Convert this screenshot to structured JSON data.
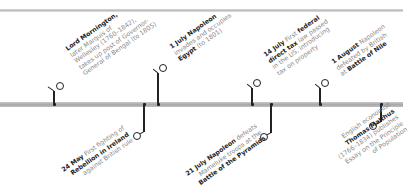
{
  "timeline": {
    "colors": {
      "bar": "#b0b0b0",
      "connector": "#222222",
      "bold_text": "#1e1e1e",
      "text": "#8a8a8a"
    },
    "events": [
      {
        "id": "mornington",
        "position": "above",
        "x": 54,
        "lines": [
          [
            {
              "b": "Lord Mornington,"
            }
          ],
          [
            {
              "t": "later Marquis of"
            }
          ],
          [
            {
              "t": "Wellesley (1760–1842),"
            }
          ],
          [
            {
              "t": "takes up post of Governor-"
            }
          ],
          [
            {
              "t": "General of Bengal (to 1805)"
            }
          ]
        ]
      },
      {
        "id": "egypt",
        "position": "above",
        "x": 158,
        "lines": [
          [
            {
              "b": "1 July Napoleon"
            }
          ],
          [
            {
              "t": "invades and occupies"
            }
          ],
          [
            {
              "b": "Egypt"
            },
            {
              "t": " (to 1801)"
            }
          ]
        ]
      },
      {
        "id": "federal-tax",
        "position": "above",
        "x": 252,
        "lines": [
          [
            {
              "b": "14 July"
            },
            {
              "t": " First "
            },
            {
              "b": "federal"
            }
          ],
          [
            {
              "b": "direct tax"
            },
            {
              "t": " law passed"
            }
          ],
          [
            {
              "t": "in the US, introducing"
            }
          ],
          [
            {
              "t": "tax on property"
            }
          ]
        ]
      },
      {
        "id": "nile",
        "position": "above",
        "x": 320,
        "lines": [
          [
            {
              "b": "1 August"
            },
            {
              "t": " Napoleon"
            }
          ],
          [
            {
              "t": "defeated by British"
            }
          ],
          [
            {
              "t": "at "
            },
            {
              "b": "Battle of Nile"
            }
          ]
        ]
      },
      {
        "id": "ireland",
        "position": "below",
        "x": 144,
        "lines": [
          [
            {
              "b": "24 May"
            },
            {
              "t": " First fighting of"
            }
          ],
          [
            {
              "b": "Rebellion in Ireland"
            }
          ],
          [
            {
              "t": "against British rule"
            }
          ]
        ]
      },
      {
        "id": "pyramids",
        "position": "below",
        "x": 271,
        "lines": [
          [
            {
              "b": "21 July Napoleon"
            },
            {
              "t": " defeats"
            }
          ],
          [
            {
              "t": "Mameluke troops at the"
            }
          ],
          [
            {
              "b": "Battle of the Pyramids"
            }
          ]
        ]
      },
      {
        "id": "malthus",
        "position": "below",
        "x": 381,
        "lines": [
          [
            {
              "t": "English economist"
            }
          ],
          [
            {
              "b": "Thomas Malthus"
            }
          ],
          [
            {
              "t": "(1766–1834) publishes"
            }
          ],
          [
            {
              "t": "Essay on the Principle"
            }
          ],
          [
            {
              "t": "of Population"
            }
          ]
        ]
      }
    ]
  }
}
